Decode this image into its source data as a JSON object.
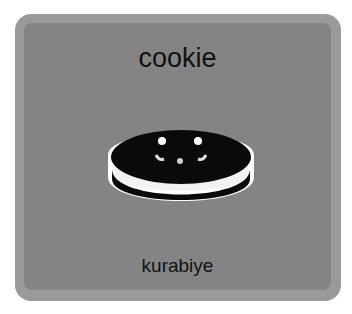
{
  "card": {
    "word": "cookie",
    "translation": "kurabiye",
    "image": {
      "icon": "cookie-icon",
      "description": "sandwich cookie with smiling face"
    },
    "colors": {
      "frame": "#9a9a9a",
      "panel": "#848484",
      "text": "#111111"
    }
  }
}
